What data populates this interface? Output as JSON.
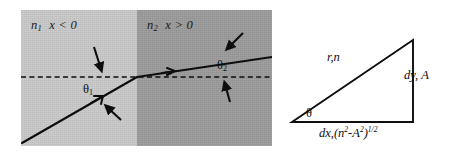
{
  "figure": {
    "type": "physics-diagram",
    "colors": {
      "background": "#ffffff",
      "region_left_fill": "#c9c9c9",
      "region_right_fill": "#9a9a9a",
      "line": "#0d0d0d",
      "text": "#111111"
    }
  },
  "left_panel": {
    "name": "refraction-panel",
    "regions": [
      {
        "id": "region-left",
        "index_label": "n",
        "index_subscript": "1",
        "condition": "x < 0",
        "full_label": "n1  x < 0",
        "fill": "#c9c9c9"
      },
      {
        "id": "region-right",
        "index_label": "n",
        "index_subscript": "2",
        "condition": "x > 0",
        "full_label": "n2  x > 0",
        "fill": "#9a9a9a"
      }
    ],
    "interface": {
      "name": "media-boundary",
      "x_px": 137,
      "orientation": "vertical"
    },
    "dashed_line": {
      "name": "optical-axis",
      "style": "dashed",
      "y_px": 77,
      "label": ""
    },
    "rays": [
      {
        "name": "incident-ray",
        "from": [
          22,
          143
        ],
        "to": [
          137,
          77
        ],
        "arrow": "mid-forward"
      },
      {
        "name": "refracted-ray",
        "from": [
          137,
          77
        ],
        "to": [
          272,
          57
        ],
        "arrow": "mid-forward"
      }
    ],
    "angles": [
      {
        "name": "theta1",
        "symbol": "θ",
        "subscript": "1",
        "text": "θ1",
        "position": "below-axis-left"
      },
      {
        "name": "theta2",
        "symbol": "θ",
        "subscript": "2",
        "text": "θ2",
        "position": "above-axis-right"
      }
    ],
    "pointer_arrows": [
      {
        "name": "pointer-to-axis-left",
        "direction": "down"
      },
      {
        "name": "pointer-to-incident-ray",
        "direction": "up-left"
      },
      {
        "name": "pointer-to-refracted-ray",
        "direction": "down-left"
      },
      {
        "name": "pointer-to-axis-right",
        "direction": "up"
      }
    ]
  },
  "right_panel": {
    "name": "triangle-panel",
    "shape": "right-triangle",
    "vertices": {
      "left": [
        10,
        108
      ],
      "bottom_right": [
        131,
        108
      ],
      "top_right": [
        131,
        26
      ]
    },
    "labels": {
      "hypotenuse": "r,n",
      "vertical_leg": "dy, A",
      "angle": "θ",
      "horizontal_leg_prefix": "dx,(n",
      "horizontal_leg_sup1": "2",
      "horizontal_leg_mid": "-A",
      "horizontal_leg_sup2": "2",
      "horizontal_leg_close": ")",
      "horizontal_leg_sup3": "1/2",
      "horizontal_leg_full": "dx,(n2-A2)1/2"
    }
  }
}
